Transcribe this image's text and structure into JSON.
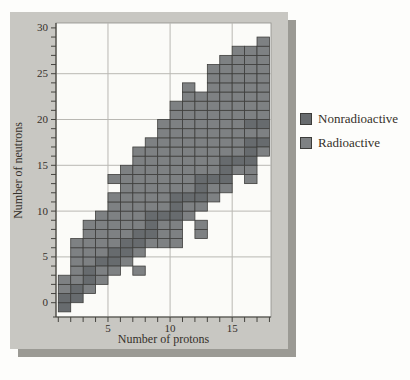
{
  "figure": {
    "panel_bg": "#c8c7c2",
    "panel_shadow": "#9b9a94",
    "plot_bg": "#fbfbf8",
    "grid_color": "#b9b8b3",
    "frame_color": "#8f8f8a",
    "axis_color": "#45443f",
    "cell_border": "#3e3e3c",
    "text_color": "#35302a"
  },
  "legend": {
    "items": [
      {
        "label": "Nonradioactive",
        "color": "#676b6e"
      },
      {
        "label": "Radioactive",
        "color": "#7e8183"
      }
    ]
  },
  "chart_data": {
    "type": "heatmap",
    "title": "",
    "xlabel": "Number of protons",
    "ylabel": "Number of neutrons",
    "x_axis": {
      "ticks_from": 1,
      "ticks_to": 18,
      "tick_step": 1,
      "labeled_ticks": [
        5,
        10,
        15
      ]
    },
    "y_axis": {
      "ticks_from": 0,
      "ticks_to": 30,
      "tick_step": 1,
      "labeled_ticks": [
        0,
        5,
        10,
        15,
        20,
        25,
        30
      ]
    },
    "x_gridlines": [
      5,
      10,
      15
    ],
    "y_gridlines": [
      5,
      10,
      15,
      20,
      25
    ],
    "grid_on": true,
    "legend_position": "right",
    "cell_unit": "each square = 1 proton × 1 neutron nuclide",
    "series": [
      {
        "name": "Nonradioactive",
        "color": "#676b6e",
        "cells": [
          [
            1,
            0
          ],
          [
            1,
            1
          ],
          [
            2,
            1
          ],
          [
            2,
            2
          ],
          [
            3,
            3
          ],
          [
            3,
            4
          ],
          [
            4,
            5
          ],
          [
            5,
            5
          ],
          [
            5,
            6
          ],
          [
            6,
            6
          ],
          [
            6,
            7
          ],
          [
            7,
            7
          ],
          [
            7,
            8
          ],
          [
            8,
            8
          ],
          [
            8,
            9
          ],
          [
            8,
            10
          ],
          [
            9,
            10
          ],
          [
            10,
            10
          ],
          [
            10,
            11
          ],
          [
            10,
            12
          ],
          [
            11,
            12
          ],
          [
            12,
            12
          ],
          [
            12,
            13
          ],
          [
            12,
            14
          ],
          [
            13,
            14
          ],
          [
            14,
            14
          ],
          [
            14,
            15
          ],
          [
            14,
            16
          ],
          [
            15,
            16
          ],
          [
            16,
            16
          ],
          [
            16,
            17
          ],
          [
            16,
            18
          ],
          [
            16,
            20
          ],
          [
            17,
            18
          ],
          [
            17,
            20
          ]
        ]
      },
      {
        "name": "Radioactive",
        "color": "#7e8183",
        "cells": [
          [
            1,
            2
          ],
          [
            1,
            3
          ],
          [
            2,
            3
          ],
          [
            2,
            4
          ],
          [
            2,
            5
          ],
          [
            2,
            6
          ],
          [
            2,
            7
          ],
          [
            3,
            2
          ],
          [
            3,
            5
          ],
          [
            3,
            6
          ],
          [
            3,
            7
          ],
          [
            3,
            8
          ],
          [
            3,
            9
          ],
          [
            4,
            3
          ],
          [
            4,
            4
          ],
          [
            4,
            6
          ],
          [
            4,
            7
          ],
          [
            4,
            8
          ],
          [
            4,
            9
          ],
          [
            4,
            10
          ],
          [
            5,
            4
          ],
          [
            5,
            7
          ],
          [
            5,
            8
          ],
          [
            5,
            9
          ],
          [
            5,
            10
          ],
          [
            5,
            11
          ],
          [
            5,
            12
          ],
          [
            5,
            14
          ],
          [
            6,
            5
          ],
          [
            6,
            8
          ],
          [
            6,
            9
          ],
          [
            6,
            10
          ],
          [
            6,
            11
          ],
          [
            6,
            12
          ],
          [
            6,
            13
          ],
          [
            6,
            14
          ],
          [
            6,
            15
          ],
          [
            7,
            4
          ],
          [
            7,
            6
          ],
          [
            7,
            9
          ],
          [
            7,
            10
          ],
          [
            7,
            11
          ],
          [
            7,
            12
          ],
          [
            7,
            13
          ],
          [
            7,
            14
          ],
          [
            7,
            15
          ],
          [
            7,
            16
          ],
          [
            7,
            17
          ],
          [
            8,
            7
          ],
          [
            8,
            11
          ],
          [
            8,
            12
          ],
          [
            8,
            13
          ],
          [
            8,
            14
          ],
          [
            8,
            15
          ],
          [
            8,
            16
          ],
          [
            8,
            17
          ],
          [
            8,
            18
          ],
          [
            9,
            7
          ],
          [
            9,
            8
          ],
          [
            9,
            9
          ],
          [
            9,
            11
          ],
          [
            9,
            12
          ],
          [
            9,
            13
          ],
          [
            9,
            14
          ],
          [
            9,
            15
          ],
          [
            9,
            16
          ],
          [
            9,
            17
          ],
          [
            9,
            18
          ],
          [
            9,
            19
          ],
          [
            9,
            20
          ],
          [
            10,
            7
          ],
          [
            10,
            8
          ],
          [
            10,
            9
          ],
          [
            10,
            13
          ],
          [
            10,
            14
          ],
          [
            10,
            15
          ],
          [
            10,
            16
          ],
          [
            10,
            17
          ],
          [
            10,
            18
          ],
          [
            10,
            19
          ],
          [
            10,
            20
          ],
          [
            10,
            21
          ],
          [
            10,
            22
          ],
          [
            11,
            10
          ],
          [
            11,
            11
          ],
          [
            11,
            13
          ],
          [
            11,
            14
          ],
          [
            11,
            15
          ],
          [
            11,
            16
          ],
          [
            11,
            17
          ],
          [
            11,
            18
          ],
          [
            11,
            19
          ],
          [
            11,
            20
          ],
          [
            11,
            21
          ],
          [
            11,
            22
          ],
          [
            11,
            23
          ],
          [
            11,
            24
          ],
          [
            12,
            8
          ],
          [
            12,
            9
          ],
          [
            12,
            11
          ],
          [
            12,
            15
          ],
          [
            12,
            16
          ],
          [
            12,
            17
          ],
          [
            12,
            18
          ],
          [
            12,
            19
          ],
          [
            12,
            20
          ],
          [
            12,
            21
          ],
          [
            12,
            22
          ],
          [
            12,
            23
          ],
          [
            13,
            12
          ],
          [
            13,
            13
          ],
          [
            13,
            15
          ],
          [
            13,
            16
          ],
          [
            13,
            17
          ],
          [
            13,
            18
          ],
          [
            13,
            19
          ],
          [
            13,
            20
          ],
          [
            13,
            21
          ],
          [
            13,
            22
          ],
          [
            13,
            23
          ],
          [
            13,
            24
          ],
          [
            13,
            25
          ],
          [
            13,
            26
          ],
          [
            14,
            13
          ],
          [
            14,
            17
          ],
          [
            14,
            18
          ],
          [
            14,
            19
          ],
          [
            14,
            20
          ],
          [
            14,
            21
          ],
          [
            14,
            22
          ],
          [
            14,
            23
          ],
          [
            14,
            24
          ],
          [
            14,
            25
          ],
          [
            14,
            26
          ],
          [
            14,
            27
          ],
          [
            15,
            15
          ],
          [
            15,
            17
          ],
          [
            15,
            18
          ],
          [
            15,
            19
          ],
          [
            15,
            20
          ],
          [
            15,
            21
          ],
          [
            15,
            22
          ],
          [
            15,
            23
          ],
          [
            15,
            24
          ],
          [
            15,
            25
          ],
          [
            15,
            26
          ],
          [
            15,
            27
          ],
          [
            15,
            28
          ],
          [
            16,
            14
          ],
          [
            16,
            15
          ],
          [
            16,
            19
          ],
          [
            16,
            21
          ],
          [
            16,
            22
          ],
          [
            16,
            23
          ],
          [
            16,
            24
          ],
          [
            16,
            25
          ],
          [
            16,
            26
          ],
          [
            16,
            27
          ],
          [
            16,
            28
          ],
          [
            17,
            17
          ],
          [
            17,
            19
          ],
          [
            17,
            21
          ],
          [
            17,
            22
          ],
          [
            17,
            23
          ],
          [
            17,
            24
          ],
          [
            17,
            25
          ],
          [
            17,
            26
          ],
          [
            17,
            27
          ],
          [
            17,
            28
          ],
          [
            17,
            29
          ]
        ]
      }
    ]
  }
}
